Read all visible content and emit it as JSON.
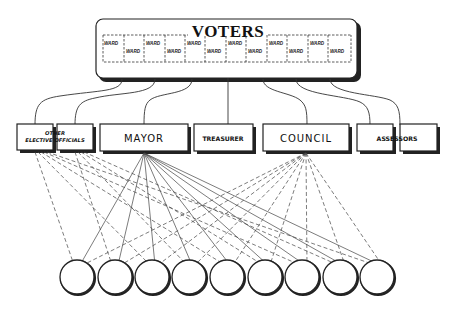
{
  "voters": {
    "title": "VOTERS",
    "ward_label": "WARD",
    "ward_count": 12
  },
  "offices": [
    {
      "id": "other-elective-officials",
      "label_line1": "OTHER",
      "label_line2": "ELECTIVE OFFICIALS",
      "boxes": 2
    },
    {
      "id": "mayor",
      "label": "MAYOR"
    },
    {
      "id": "treasurer",
      "label": "TREASURER"
    },
    {
      "id": "council",
      "label": "COUNCIL"
    },
    {
      "id": "assessors",
      "label": "ASSESSORS",
      "boxes": 2
    }
  ],
  "departments": {
    "count": 9,
    "labels": []
  },
  "legend": {
    "solid_lines": "Mayor to departments",
    "dashed_lines": "Council and other elective officials to departments"
  },
  "colors": {
    "ink": "#222222",
    "background": "#ffffff"
  }
}
